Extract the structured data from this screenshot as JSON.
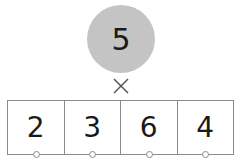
{
  "multiplier": "5",
  "operator": "×",
  "digits": [
    "2",
    "3",
    "6",
    "4"
  ],
  "colors": {
    "circle": "#c4c4c4",
    "lines": "#8a8a8a",
    "text": "#1a1a1a"
  }
}
